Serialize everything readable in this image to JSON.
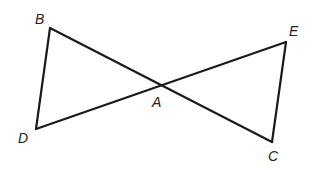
{
  "diagram": {
    "type": "geometry",
    "points": {
      "B": {
        "label": "B",
        "x": 50,
        "y": 28,
        "label_x": 35,
        "label_y": 24
      },
      "D": {
        "label": "D",
        "x": 36,
        "y": 129,
        "label_x": 18,
        "label_y": 143
      },
      "A": {
        "label": "A",
        "x": 158,
        "y": 85,
        "label_x": 152,
        "label_y": 107
      },
      "E": {
        "label": "E",
        "x": 286,
        "y": 42,
        "label_x": 289,
        "label_y": 36
      },
      "C": {
        "label": "C",
        "x": 272,
        "y": 142,
        "label_x": 268,
        "label_y": 161
      }
    },
    "segments": [
      {
        "from": "B",
        "to": "C"
      },
      {
        "from": "D",
        "to": "E"
      },
      {
        "from": "B",
        "to": "D"
      },
      {
        "from": "E",
        "to": "C"
      }
    ],
    "colors": {
      "line": "#1a1a1a",
      "label": "#222222",
      "background": "#ffffff"
    }
  }
}
